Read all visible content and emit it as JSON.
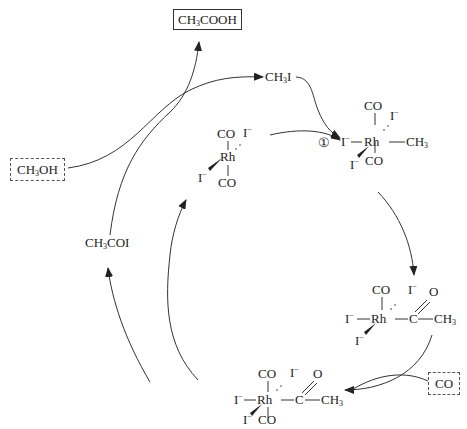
{
  "diagram": {
    "type": "catalytic-cycle",
    "products": {
      "acetic_acid": {
        "base": "CH",
        "sub": "3",
        "tail": "COOH"
      }
    },
    "reactants": {
      "methanol": {
        "base": "CH",
        "sub": "3",
        "tail": "OH"
      },
      "carbon_monoxide": "CO"
    },
    "intermediates": {
      "methyl_iodide": {
        "base": "CH",
        "sub": "3",
        "tail": "I"
      },
      "acetyl_iodide": {
        "base": "CH",
        "sub": "3",
        "tail": "COI"
      }
    },
    "step_marker": "①",
    "complexes": {
      "catalyst": {
        "center": "Rh",
        "ligands": [
          "CO",
          "CO",
          "I⁻",
          "I⁻"
        ]
      },
      "methyl_complex": {
        "center": "Rh",
        "ligands": [
          "CO",
          "CO",
          "I⁻",
          "I⁻",
          "I⁻",
          "CH₃"
        ]
      },
      "acyl_complex": {
        "center": "Rh",
        "ligands": [
          "CO",
          "I⁻",
          "I⁻",
          "I⁻",
          "C(=O)CH₃"
        ]
      },
      "acyl_carbonyl_complex": {
        "center": "Rh",
        "ligands": [
          "CO",
          "CO",
          "I⁻",
          "I⁻",
          "I⁻",
          "C(=O)CH₃"
        ]
      }
    },
    "text": {
      "CO": "CO",
      "Rh": "Rh",
      "I": "I",
      "minus": "−",
      "C": "C",
      "O": "O",
      "CH": "CH",
      "sub3": "3"
    },
    "colors": {
      "line": "#333333",
      "text": "#222222",
      "background": "#ffffff"
    }
  }
}
